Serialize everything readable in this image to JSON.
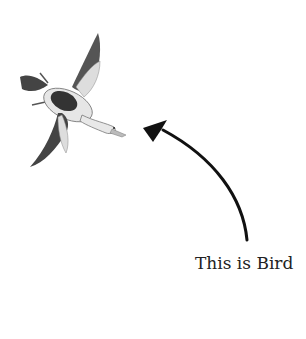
{
  "illustration": {
    "subject": "bird-in-flight",
    "caption": "This is Bird"
  },
  "colors": {
    "background": "#ffffff",
    "ink": "#111111",
    "caption": "#222222"
  }
}
